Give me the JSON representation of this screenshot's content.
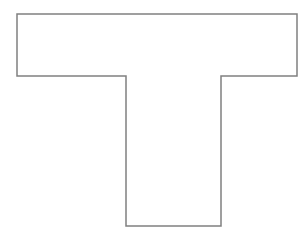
{
  "figure": {
    "canvas": {
      "width": 306,
      "height": 237,
      "background_color": "#ffffff"
    },
    "shape": {
      "name": "t-shape",
      "kind": "polygon",
      "closed": true,
      "fill_color": "#ffffff",
      "stroke_color": "#808080",
      "stroke_width": 1.5,
      "vertex_count": 8,
      "points": [
        [
          17,
          14
        ],
        [
          297,
          14
        ],
        [
          297,
          76
        ],
        [
          221,
          76
        ],
        [
          221,
          226
        ],
        [
          126,
          226
        ],
        [
          126,
          76
        ],
        [
          17,
          76
        ]
      ],
      "points_attr": "17,14 297,14 297,76 221,76 221,226 126,226 126,76 17,76",
      "parts": {
        "crossbar": {
          "label": "horizontal crossbar",
          "left": 17,
          "top": 14,
          "right": 297,
          "bottom": 76,
          "width": 280,
          "height": 62
        },
        "stem": {
          "label": "vertical stem",
          "left": 126,
          "top": 76,
          "right": 221,
          "bottom": 226,
          "width": 95,
          "height": 150
        }
      }
    }
  }
}
